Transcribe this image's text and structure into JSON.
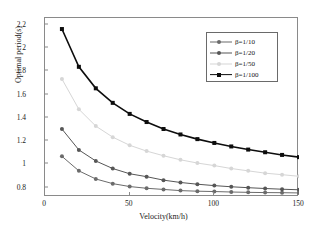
{
  "chart_data": {
    "type": "line",
    "title": "",
    "xlabel": "Velocity(km/h)",
    "ylabel": "Optimal period(s)",
    "xlim": [
      0,
      150
    ],
    "ylim": [
      0.72,
      2.26
    ],
    "xticks": [
      0,
      50,
      100,
      150
    ],
    "yticks": [
      0.8,
      1,
      1.2,
      1.4,
      1.6,
      1.8,
      2,
      2.2
    ],
    "ytick_labels": [
      "0.8",
      "1",
      "1.2",
      "1.4",
      "1.6",
      "1.8",
      "2",
      "2.2"
    ],
    "xtick_labels": [
      "0",
      "50",
      "100",
      "150"
    ],
    "grid": false,
    "legend_position": "upper right",
    "x": [
      10,
      20,
      30,
      40,
      50,
      60,
      70,
      80,
      90,
      100,
      110,
      120,
      130,
      140,
      150
    ],
    "series": [
      {
        "name": "β=1/10",
        "color": "#6b6b6b",
        "marker": "circle",
        "values": [
          1.07,
          0.945,
          0.875,
          0.835,
          0.81,
          0.795,
          0.785,
          0.775,
          0.77,
          0.767,
          0.763,
          0.76,
          0.758,
          0.757,
          0.755
        ]
      },
      {
        "name": "β=1/20",
        "color": "#565656",
        "marker": "circle",
        "values": [
          1.305,
          1.125,
          1.03,
          0.965,
          0.92,
          0.895,
          0.865,
          0.845,
          0.83,
          0.818,
          0.808,
          0.8,
          0.793,
          0.787,
          0.782
        ]
      },
      {
        "name": "β=1/50",
        "color": "#d6d6d6",
        "marker": "circle",
        "values": [
          1.735,
          1.475,
          1.33,
          1.235,
          1.165,
          1.115,
          1.075,
          1.04,
          1.012,
          0.99,
          0.965,
          0.945,
          0.925,
          0.912,
          0.898
        ]
      },
      {
        "name": "β=1/100",
        "color": "#0d0d0d",
        "marker": "square",
        "values": [
          2.165,
          1.84,
          1.655,
          1.53,
          1.435,
          1.365,
          1.305,
          1.258,
          1.218,
          1.185,
          1.155,
          1.128,
          1.105,
          1.082,
          1.063
        ]
      }
    ]
  },
  "axes": {
    "frame_color": "#8a8a8a"
  }
}
